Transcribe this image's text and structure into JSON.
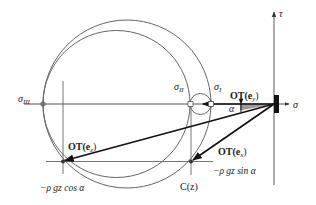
{
  "diagram": {
    "axes": {
      "sigma_label": "σ",
      "tau_label": "τ"
    },
    "principal_stresses": {
      "sigma_I": "σ",
      "sigma_I_sub": "I",
      "sigma_II": "σ",
      "sigma_II_sub": "II",
      "sigma_III": "σ",
      "sigma_III_sub": "III"
    },
    "vectors": {
      "ey": {
        "label_prefix": "OT(",
        "label_e": "e",
        "label_sub": "y",
        "label_suffix": ")"
      },
      "ez": {
        "label_prefix": "OT(",
        "label_e": "e",
        "label_sub": "z",
        "label_suffix": ")"
      },
      "ex": {
        "label_prefix": "OT(",
        "label_e": "e",
        "label_sub": "x",
        "label_suffix": ")"
      }
    },
    "annotations": {
      "angle": "α",
      "cos_component": "−ρ gz cos α",
      "sin_component": "−ρ gz sin α",
      "center_label": "C(z)"
    },
    "colors": {
      "line": "#555555",
      "arrow": "#111111",
      "angle_fill": "#9a9a9a",
      "block": "#111111"
    }
  }
}
